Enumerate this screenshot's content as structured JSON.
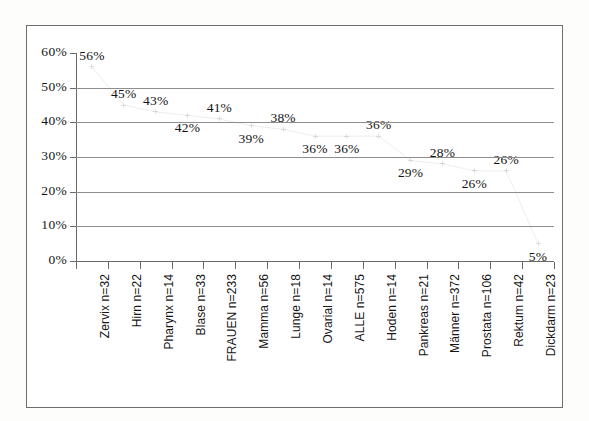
{
  "figure": {
    "background_color": "#ffffff",
    "frame_color": "#6e6e6e",
    "grid_color": "#8e8e8e"
  },
  "chart_data": {
    "type": "line",
    "title": "",
    "subtitle": "",
    "xlabel": "",
    "ylabel": "",
    "ylim": [
      0,
      60
    ],
    "ytick_labels": [
      "0%",
      "10%",
      "20%",
      "30%",
      "40%",
      "50%",
      "60%"
    ],
    "ytick_values": [
      0,
      10,
      20,
      30,
      40,
      50,
      60
    ],
    "grid": true,
    "legend": "none",
    "categories": [
      "Zervix n=32",
      "Hirn n=22",
      "Pharynx n=14",
      "Blase n=33",
      "FRAUEN n=233",
      "Mamma n=56",
      "Lunge n=18",
      "Ovarial n=14",
      "ALLE n=575",
      "Hoden n=14",
      "Pankreas n=21",
      "Männer n=372",
      "Prostata n=106",
      "Rektum n=42",
      "Dickdarm n=23"
    ],
    "values": [
      56,
      45,
      43,
      42,
      41,
      39,
      38,
      36,
      36,
      36,
      29,
      28,
      26,
      26,
      5
    ],
    "data_labels": [
      "56%",
      "45%",
      "43%",
      "42%",
      "41%",
      "39%",
      "38%",
      "36%",
      "36%",
      "36%",
      "29%",
      "28%",
      "26%",
      "26%",
      "5%"
    ],
    "label_placement": [
      "above",
      "above",
      "above",
      "below",
      "above",
      "below",
      "above",
      "below",
      "below",
      "above",
      "below",
      "above",
      "below",
      "above",
      "below"
    ]
  }
}
